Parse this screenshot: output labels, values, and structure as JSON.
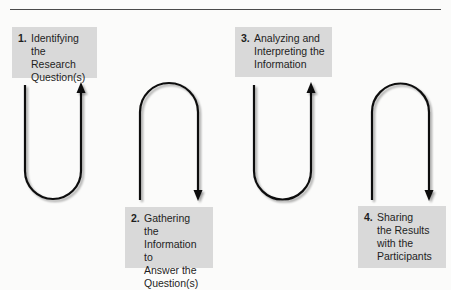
{
  "diagram": {
    "type": "process-flow",
    "steps": [
      {
        "number": "1.",
        "label": "Identifying\nthe Research\nQuestion(s)",
        "position": "top"
      },
      {
        "number": "2.",
        "label": "Gathering the\nInformation to\nAnswer the\nQuestion(s)",
        "position": "bottom"
      },
      {
        "number": "3.",
        "label": "Analyzing and\nInterpreting the\nInformation",
        "position": "top"
      },
      {
        "number": "4.",
        "label": "Sharing\nthe Results\nwith the\nParticipants",
        "position": "bottom"
      }
    ],
    "connectors": [
      {
        "shape": "U",
        "direction": "up",
        "points_to_step": 1
      },
      {
        "shape": "inverted-U",
        "direction": "down",
        "points_to_step": 2
      },
      {
        "shape": "U",
        "direction": "up",
        "points_to_step": 3
      },
      {
        "shape": "inverted-U",
        "direction": "down",
        "points_to_step": 4
      }
    ],
    "colors": {
      "box_fill": "#d9d9d9",
      "line": "#111111",
      "rule": "#4a4a4a",
      "background": "#fbfbfa"
    }
  }
}
